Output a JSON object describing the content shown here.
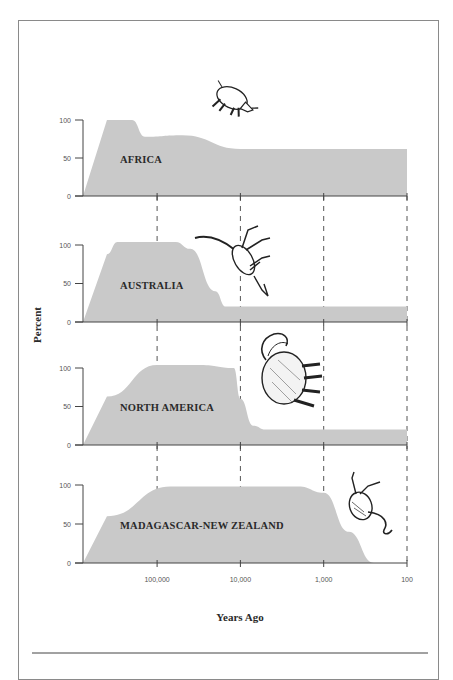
{
  "chart_data": {
    "type": "area",
    "title": "",
    "xlabel": "Years Ago",
    "ylabel": "Percent",
    "x_scale": "log-reversed",
    "x_ticks": [
      "100,000",
      "10,000",
      "1,000",
      "100"
    ],
    "y_ticks": [
      "0",
      "50",
      "100"
    ],
    "ylim": [
      0,
      100
    ],
    "grid": "dashed vertical lines at x ticks",
    "legend": "none (panel labels inline)",
    "fill_color": "#c9c9c9",
    "panels": [
      {
        "name": "AFRICA",
        "illustration": "rhinoceros",
        "points": [
          [
            400000,
            100
          ],
          [
            200000,
            100
          ],
          [
            140000,
            78
          ],
          [
            50000,
            80
          ],
          [
            10000,
            62
          ],
          [
            100,
            62
          ]
        ]
      },
      {
        "name": "AUSTRALIA",
        "illustration": "kangaroo",
        "points": [
          [
            400000,
            88
          ],
          [
            300000,
            104
          ],
          [
            60000,
            104
          ],
          [
            40000,
            95
          ],
          [
            20000,
            40
          ],
          [
            15000,
            20
          ],
          [
            100,
            20
          ]
        ]
      },
      {
        "name": "NORTH AMERICA",
        "illustration": "mammoth",
        "points": [
          [
            400000,
            63
          ],
          [
            100000,
            104
          ],
          [
            30000,
            104
          ],
          [
            12000,
            100
          ],
          [
            10000,
            60
          ],
          [
            7000,
            25
          ],
          [
            5000,
            20
          ],
          [
            100,
            20
          ]
        ]
      },
      {
        "name": "MADAGASCAR-NEW ZEALAND",
        "illustration": "moa bird",
        "points": [
          [
            400000,
            60
          ],
          [
            70000,
            98
          ],
          [
            2000,
            98
          ],
          [
            1000,
            90
          ],
          [
            500,
            40
          ],
          [
            250,
            0
          ]
        ]
      }
    ]
  },
  "labels": {
    "ylabel": "Percent",
    "xlabel": "Years Ago"
  }
}
